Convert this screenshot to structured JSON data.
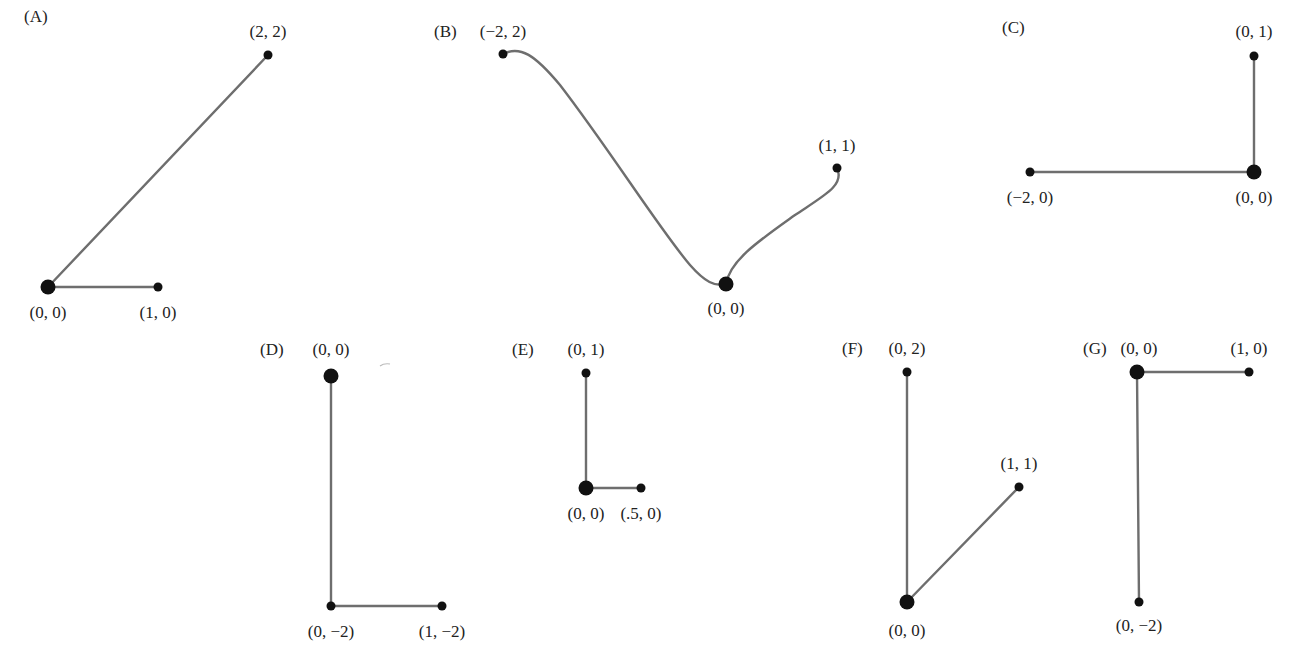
{
  "figure": {
    "panels": [
      {
        "id": "A",
        "label": "(A)",
        "label_pos": [
          24,
          22
        ],
        "root": {
          "text": "(0, 0)",
          "px": [
            48,
            287
          ],
          "label_pos": [
            48,
            318
          ]
        },
        "leaves": [
          {
            "text": "(2, 2)",
            "px": [
              268,
              55
            ],
            "label_pos": [
              268,
              37
            ],
            "shape": "line"
          },
          {
            "text": "(1, 0)",
            "px": [
              158,
              287
            ],
            "label_pos": [
              158,
              318
            ],
            "shape": "line"
          }
        ]
      },
      {
        "id": "B",
        "label": "(B)",
        "label_pos": [
          434,
          37
        ],
        "root": {
          "text": "(0, 0)",
          "px": [
            726,
            284
          ],
          "label_pos": [
            726,
            314
          ]
        },
        "leaves": [
          {
            "text": "(−2, 2)",
            "px": [
              503,
              54
            ],
            "label_pos": [
              503,
              37
            ],
            "shape": "curve",
            "path": "M503,54 C520,45 535,55 560,85 C610,150 660,230 690,265 C705,282 715,287 726,284"
          },
          {
            "text": "(1, 1)",
            "px": [
              837,
              168
            ],
            "label_pos": [
              837,
              151
            ],
            "shape": "curve",
            "path": "M726,284 C730,260 760,240 795,215 C825,195 845,185 837,168"
          }
        ]
      },
      {
        "id": "C",
        "label": "(C)",
        "label_pos": [
          1002,
          33
        ],
        "root": {
          "text": "(0, 0)",
          "px": [
            1254,
            172
          ],
          "label_pos": [
            1254,
            203
          ]
        },
        "leaves": [
          {
            "text": "(0, 1)",
            "px": [
              1254,
              56
            ],
            "label_pos": [
              1254,
              37
            ],
            "shape": "line"
          },
          {
            "text": "(−2, 0)",
            "px": [
              1030,
              172
            ],
            "label_pos": [
              1030,
              203
            ],
            "shape": "line"
          }
        ]
      },
      {
        "id": "D",
        "label": "(D)",
        "label_pos": [
          260,
          355
        ],
        "root": {
          "text": "(0, 0)",
          "px": [
            331,
            376
          ],
          "label_pos": [
            331,
            355
          ]
        },
        "leaves": [
          {
            "text": "(0, −2)",
            "px": [
              331,
              606
            ],
            "label_pos": [
              331,
              637
            ],
            "shape": "line"
          },
          {
            "text": "(1, −2)",
            "px": [
              442,
              606
            ],
            "label_pos": [
              442,
              637
            ],
            "shape": "line",
            "from_leaf": 0
          }
        ]
      },
      {
        "id": "E",
        "label": "(E)",
        "label_pos": [
          512,
          355
        ],
        "root": {
          "text": "(0, 0)",
          "px": [
            586,
            488
          ],
          "label_pos": [
            586,
            519
          ]
        },
        "leaves": [
          {
            "text": "(0, 1)",
            "px": [
              586,
              373
            ],
            "label_pos": [
              586,
              355
            ],
            "shape": "line"
          },
          {
            "text": "(.5, 0)",
            "px": [
              641,
              488
            ],
            "label_pos": [
              641,
              519
            ],
            "shape": "line"
          }
        ]
      },
      {
        "id": "F",
        "label": "(F)",
        "label_pos": [
          842,
          354
        ],
        "root": {
          "text": "(0, 0)",
          "px": [
            907,
            602
          ],
          "label_pos": [
            907,
            636
          ]
        },
        "leaves": [
          {
            "text": "(0, 2)",
            "px": [
              907,
              372
            ],
            "label_pos": [
              907,
              354
            ],
            "shape": "line"
          },
          {
            "text": "(1, 1)",
            "px": [
              1019,
              487
            ],
            "label_pos": [
              1019,
              469
            ],
            "shape": "line"
          }
        ]
      },
      {
        "id": "G",
        "label": "(G)",
        "label_pos": [
          1083,
          354
        ],
        "root": {
          "text": "(0, 0)",
          "px": [
            1137,
            372
          ],
          "label_pos": [
            1139,
            354
          ]
        },
        "leaves": [
          {
            "text": "(1, 0)",
            "px": [
              1249,
              372
            ],
            "label_pos": [
              1249,
              354
            ],
            "shape": "line"
          },
          {
            "text": "(0, −2)",
            "px": [
              1139,
              602
            ],
            "label_pos": [
              1139,
              631
            ],
            "shape": "line"
          }
        ]
      }
    ],
    "colors": {
      "edge": "#6e6e6e",
      "node": "#111111",
      "text": "#222222"
    },
    "stray_mark": {
      "px": [
        385,
        364
      ]
    }
  }
}
